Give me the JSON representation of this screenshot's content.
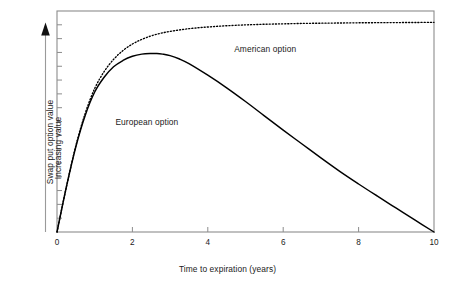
{
  "chart_data": {
    "type": "line",
    "title": "",
    "subtitle": "",
    "xlabel": "Time to expiration (years)",
    "ylabel": "Swap put option value",
    "ylabel_secondary": "Increasing value",
    "ylabel_arrow": "up-arrow",
    "xlim": [
      0,
      10
    ],
    "ylim": [
      0,
      1.05
    ],
    "xticks": [
      0,
      2,
      4,
      6,
      8,
      10
    ],
    "xtick_labels": [
      "0",
      "2",
      "4",
      "6",
      "8",
      "10"
    ],
    "yticks": [],
    "ytick_labels": [],
    "ytick_minor_count": 15,
    "grid": false,
    "legend_position": "inline-annotations",
    "series": [
      {
        "name": "European option",
        "style": "solid",
        "color": "#000000",
        "x": [
          0.0,
          0.25,
          0.5,
          0.75,
          1.0,
          1.25,
          1.5,
          1.75,
          2.0,
          2.25,
          2.5,
          2.65,
          2.8,
          3.0,
          3.25,
          3.5,
          4.0,
          4.5,
          5.0,
          5.5,
          6.0,
          6.5,
          7.0,
          7.5,
          8.0,
          8.5,
          9.0,
          9.5,
          10.0
        ],
        "y": [
          0.0,
          0.215,
          0.405,
          0.555,
          0.665,
          0.735,
          0.785,
          0.815,
          0.835,
          0.845,
          0.848,
          0.848,
          0.845,
          0.838,
          0.822,
          0.8,
          0.745,
          0.685,
          0.62,
          0.552,
          0.484,
          0.418,
          0.352,
          0.288,
          0.228,
          0.17,
          0.113,
          0.056,
          0.0
        ]
      },
      {
        "name": "American option",
        "style": "dotted",
        "color": "#000000",
        "x": [
          0.0,
          0.25,
          0.5,
          0.75,
          1.0,
          1.25,
          1.5,
          1.75,
          2.0,
          2.25,
          2.5,
          2.75,
          3.0,
          3.5,
          4.0,
          4.5,
          5.0,
          5.5,
          6.0,
          6.5,
          7.0,
          7.5,
          8.0,
          8.5,
          9.0,
          9.5,
          10.0
        ],
        "y": [
          0.0,
          0.215,
          0.41,
          0.565,
          0.682,
          0.762,
          0.82,
          0.862,
          0.893,
          0.915,
          0.932,
          0.944,
          0.953,
          0.966,
          0.974,
          0.98,
          0.984,
          0.987,
          0.989,
          0.991,
          0.992,
          0.993,
          0.994,
          0.9945,
          0.995,
          0.9955,
          0.996
        ]
      }
    ],
    "annotations": [
      {
        "text": "European option",
        "x": 1.55,
        "y": 0.52
      },
      {
        "text": "American option",
        "x": 4.7,
        "y": 0.865
      }
    ]
  },
  "colors": {
    "frame": "#8c8c8c",
    "curve": "#000000",
    "text": "#1a1a1a",
    "background": "#ffffff"
  }
}
